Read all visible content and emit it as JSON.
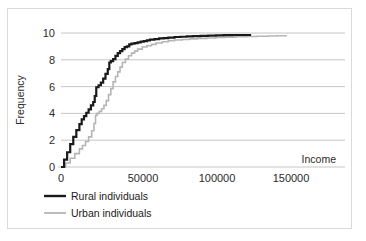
{
  "chart_data": {
    "type": "line",
    "title": "",
    "subtitle": "",
    "xlabel": "Income",
    "ylabel": "Frequency",
    "xlim": [
      0,
      170000
    ],
    "ylim": [
      0,
      10.6
    ],
    "grid": true,
    "grid_axis": "y",
    "legend_position": "below-left",
    "x_ticks": [
      "0",
      "50000",
      "100000",
      "150000"
    ],
    "x_tick_values": [
      0,
      50000,
      100000,
      150000
    ],
    "y_ticks": [
      "0",
      "2",
      "4",
      "6",
      "8",
      "10"
    ],
    "y_tick_values": [
      0,
      2,
      4,
      6,
      8,
      10
    ],
    "series": [
      {
        "name": "Rural individuals",
        "color": "#1a1a1a",
        "width": 2.2,
        "x": [
          0,
          2000,
          4000,
          6000,
          8000,
          10000,
          12000,
          13500,
          15000,
          16500,
          18000,
          19500,
          21000,
          22000,
          23000,
          24500,
          26000,
          27500,
          29000,
          30500,
          31500,
          32500,
          34000,
          35500,
          37000,
          38500,
          40000,
          41500,
          43000,
          44500,
          46000,
          48000,
          50000,
          52000,
          54000,
          56000,
          58000,
          61000,
          64000,
          67000,
          70000,
          74000,
          78000,
          82000,
          86000,
          91000,
          96000,
          101000,
          106000,
          112000,
          118000,
          124000
        ],
        "y": [
          0,
          0.55,
          1.1,
          1.7,
          2.25,
          2.75,
          3.2,
          3.55,
          3.8,
          4.05,
          4.3,
          4.6,
          4.85,
          5.3,
          5.95,
          6.1,
          6.3,
          6.6,
          6.95,
          7.3,
          7.8,
          7.9,
          8.05,
          8.3,
          8.5,
          8.65,
          8.8,
          8.95,
          9.0,
          9.15,
          9.2,
          9.25,
          9.3,
          9.35,
          9.4,
          9.45,
          9.5,
          9.55,
          9.6,
          9.62,
          9.66,
          9.7,
          9.72,
          9.75,
          9.76,
          9.78,
          9.8,
          9.82,
          9.84,
          9.85,
          9.85,
          9.85
        ]
      },
      {
        "name": "Urban individuals",
        "color": "#b5b5b5",
        "width": 1.6,
        "x": [
          0,
          3000,
          6000,
          9000,
          12000,
          14000,
          16000,
          18000,
          20000,
          21500,
          22500,
          23500,
          25000,
          26500,
          28000,
          29500,
          31000,
          32500,
          34000,
          35500,
          37000,
          38500,
          40000,
          42000,
          44000,
          46000,
          48000,
          50000,
          53000,
          56000,
          59000,
          62000,
          66000,
          70000,
          74000,
          79000,
          84000,
          89000,
          95000,
          101000,
          107000,
          114000,
          121000,
          128000,
          135000,
          141000,
          147000
        ],
        "y": [
          0,
          0.3,
          0.65,
          1.0,
          1.35,
          1.6,
          1.9,
          2.25,
          2.7,
          3.25,
          3.85,
          4.0,
          4.15,
          4.35,
          4.6,
          4.95,
          5.4,
          5.85,
          6.35,
          6.75,
          7.1,
          7.45,
          7.8,
          8.05,
          8.3,
          8.5,
          8.65,
          8.8,
          8.95,
          9.05,
          9.15,
          9.25,
          9.35,
          9.42,
          9.48,
          9.52,
          9.56,
          9.6,
          9.63,
          9.66,
          9.69,
          9.72,
          9.74,
          9.76,
          9.78,
          9.79,
          9.8
        ]
      }
    ]
  },
  "labels": {
    "y_axis_title": "Frequency",
    "x_axis_title": "Income",
    "y_tick_0": "0",
    "y_tick_1": "2",
    "y_tick_2": "4",
    "y_tick_3": "6",
    "y_tick_4": "8",
    "y_tick_5": "10",
    "x_tick_0": "0",
    "x_tick_1": "50000",
    "x_tick_2": "100000",
    "x_tick_3": "150000"
  },
  "legend": {
    "items": [
      {
        "label": "Rural individuals",
        "color": "#1a1a1a"
      },
      {
        "label": "Urban individuals",
        "color": "#b5b5b5"
      }
    ]
  },
  "colors": {
    "rural": "#1a1a1a",
    "urban": "#b5b5b5",
    "grid": "#bfbfbf",
    "border": "#d9d9d9",
    "text": "#2b2b2b",
    "background": "#ffffff"
  }
}
